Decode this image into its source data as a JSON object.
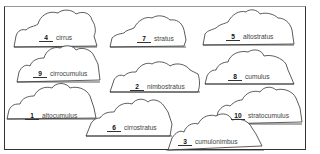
{
  "worksheet": {
    "clouds": [
      {
        "number": "4",
        "name": "cirrus"
      },
      {
        "number": "7",
        "name": "stratus"
      },
      {
        "number": "5",
        "name": "altostratus"
      },
      {
        "number": "9",
        "name": "cirrocumulus"
      },
      {
        "number": "2",
        "name": "nimbostratus"
      },
      {
        "number": "8",
        "name": "cumulus"
      },
      {
        "number": "1",
        "name": "altocumulus"
      },
      {
        "number": "6",
        "name": "cirrostratus"
      },
      {
        "number": "10",
        "name": "stratocumulus"
      },
      {
        "number": "3",
        "name": "cumulonimbus"
      }
    ]
  }
}
